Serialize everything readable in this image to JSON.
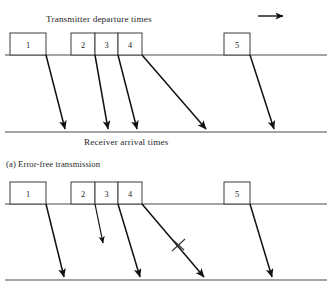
{
  "figure": {
    "title_top": "Transmitter departure times",
    "label_receiver_top": "Receiver arrival times",
    "caption_a": "(a) Error-free transmission",
    "direction_arrow": "right-arrow-icon",
    "colors": {
      "line": "#4a4a4a",
      "ray": "#111111",
      "box_stroke": "#3d3d3d",
      "text": "#262626",
      "background": "#ffffff"
    }
  },
  "panel_top": {
    "name": "error-free-transmission-panel",
    "transmitter_line_y": 55,
    "receiver_line_y": 132,
    "frames": [
      {
        "label": "1",
        "x": 10,
        "width": 36
      },
      {
        "label": "2",
        "x": 71,
        "width": 24
      },
      {
        "label": "3",
        "x": 95,
        "width": 23
      },
      {
        "label": "4",
        "x": 118,
        "width": 24
      },
      {
        "label": "5",
        "x": 224,
        "width": 26
      }
    ],
    "rays": [
      {
        "frame": "1",
        "x1": 46,
        "y1": 55,
        "x2": 65,
        "y2": 130,
        "arrow": true
      },
      {
        "frame": "2",
        "x1": 95,
        "y1": 55,
        "x2": 108,
        "y2": 130,
        "arrow": true
      },
      {
        "frame": "3",
        "x1": 118,
        "y1": 55,
        "x2": 137,
        "y2": 130,
        "arrow": true
      },
      {
        "frame": "4",
        "x1": 142,
        "y1": 55,
        "x2": 207,
        "y2": 130,
        "arrow": true
      },
      {
        "frame": "5",
        "x1": 250,
        "y1": 55,
        "x2": 275,
        "y2": 130,
        "arrow": true
      }
    ]
  },
  "panel_bottom": {
    "name": "error-transmission-panel",
    "transmitter_line_y": 204,
    "receiver_line_y": 280,
    "frames": [
      {
        "label": "1",
        "x": 10,
        "width": 36
      },
      {
        "label": "2",
        "x": 71,
        "width": 24
      },
      {
        "label": "3",
        "x": 95,
        "width": 23
      },
      {
        "label": "4",
        "x": 118,
        "width": 24
      },
      {
        "label": "5",
        "x": 224,
        "width": 26
      }
    ],
    "rays": [
      {
        "frame": "1",
        "x1": 46,
        "y1": 204,
        "x2": 64,
        "y2": 278,
        "arrow": true,
        "lost": false
      },
      {
        "frame": "2",
        "x1": 95,
        "y1": 204,
        "x2": 103,
        "y2": 244,
        "arrow": true,
        "lost": true
      },
      {
        "frame": "3",
        "x1": 118,
        "y1": 204,
        "x2": 140,
        "y2": 278,
        "arrow": true,
        "lost": false
      },
      {
        "frame": "4",
        "x1": 142,
        "y1": 204,
        "x2": 205,
        "y2": 278,
        "arrow": true,
        "lost": false
      },
      {
        "frame": "5",
        "x1": 250,
        "y1": 204,
        "x2": 273,
        "y2": 278,
        "arrow": true,
        "lost": false
      }
    ],
    "error_mark": {
      "name": "error-x-mark",
      "x": 178,
      "y": 245,
      "symbol": "x"
    }
  },
  "direction_indicator": {
    "x1": 258,
    "y": 16,
    "x2": 285
  }
}
